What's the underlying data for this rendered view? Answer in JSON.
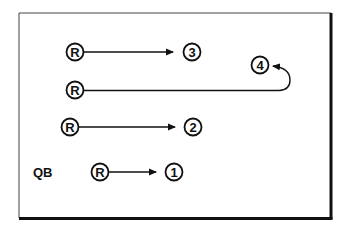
{
  "diagram": {
    "type": "football-route-diagram",
    "frame": {
      "x": 19,
      "y": 13,
      "width": 313,
      "height": 206
    },
    "routes": [
      {
        "id": "route-3",
        "from": {
          "label": "R",
          "x": 75,
          "y": 52
        },
        "to": {
          "label": "3",
          "x": 192,
          "y": 52
        },
        "shape": "straight"
      },
      {
        "id": "route-4",
        "from": {
          "label": "R",
          "x": 75,
          "y": 90
        },
        "to": {
          "label": "4",
          "x": 260,
          "y": 65
        },
        "shape": "hook-back"
      },
      {
        "id": "route-2",
        "from": {
          "label": "R",
          "x": 70,
          "y": 127
        },
        "to": {
          "label": "2",
          "x": 193,
          "y": 127
        },
        "shape": "straight"
      },
      {
        "id": "route-1",
        "from": {
          "label": "R",
          "x": 100,
          "y": 172
        },
        "to": {
          "label": "1",
          "x": 173,
          "y": 172
        },
        "shape": "straight"
      }
    ],
    "qb_label": "QB",
    "colors": {
      "ink": "#111111",
      "background": "#ffffff"
    }
  }
}
